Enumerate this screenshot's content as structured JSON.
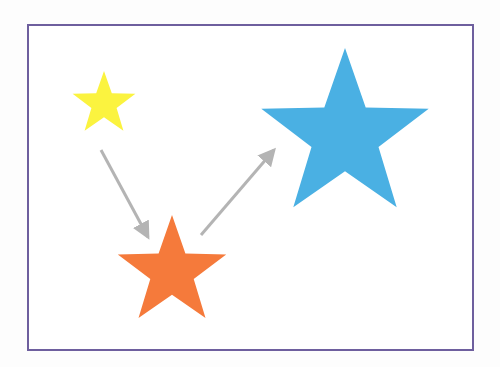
{
  "diagram": {
    "frame": {
      "border_color": "#6e5f9e"
    },
    "stars": [
      {
        "name": "small-yellow-star",
        "color": "#fbf33f",
        "cx": 104,
        "cy": 104,
        "r": 33
      },
      {
        "name": "medium-orange-star",
        "color": "#f57a3b",
        "cx": 172,
        "cy": 272,
        "r": 57
      },
      {
        "name": "large-blue-star",
        "color": "#4ab0e3",
        "cx": 345,
        "cy": 136,
        "r": 88
      }
    ],
    "arrows": [
      {
        "name": "arrow-yellow-to-orange",
        "color": "#b4b4b4",
        "from": [
          101,
          150
        ],
        "to": [
          148,
          237
        ]
      },
      {
        "name": "arrow-orange-to-blue",
        "color": "#b4b4b4",
        "from": [
          201,
          235
        ],
        "to": [
          274,
          150
        ]
      }
    ]
  }
}
